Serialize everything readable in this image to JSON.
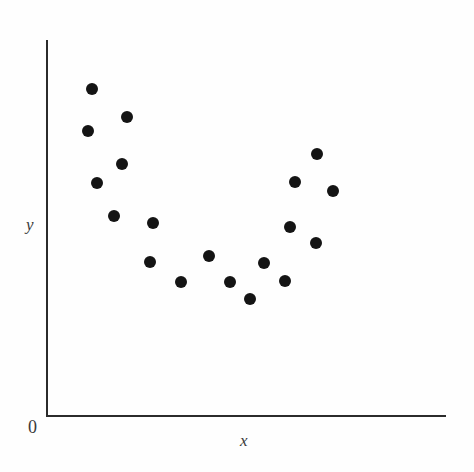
{
  "figure": {
    "width": 474,
    "height": 472,
    "background_color": "#fefefe",
    "axis_color": "#2b2b2b",
    "point_color": "#141414",
    "point_diameter": 12
  },
  "axes": {
    "y_label": "y",
    "x_label": "x",
    "origin_label": "0",
    "y_axis": {
      "x": 46,
      "y_top": 40,
      "y_bottom": 416,
      "thickness": 2
    },
    "x_axis": {
      "y": 415,
      "x_left": 46,
      "x_right": 446,
      "thickness": 2
    },
    "y_label_pos": {
      "x": 26,
      "y": 216
    },
    "x_label_pos": {
      "x": 240,
      "y": 432
    },
    "origin_label_pos": {
      "x": 28,
      "y": 418
    }
  },
  "chart_data": {
    "type": "scatter",
    "title": "",
    "subtitle": "",
    "xlabel": "x",
    "ylabel": "y",
    "grid": false,
    "legend": null,
    "axis_ticks": {
      "x": [],
      "y": []
    },
    "axis_origin_label": "0",
    "relationship": "curvilinear (U-shaped / quadratic) relationship between x and y",
    "n_points": 21,
    "xlim": [
      0,
      1
    ],
    "ylim": [
      0,
      1
    ],
    "points_px": [
      {
        "x": 92,
        "y": 89
      },
      {
        "x": 127,
        "y": 117
      },
      {
        "x": 88,
        "y": 131
      },
      {
        "x": 122,
        "y": 164
      },
      {
        "x": 97,
        "y": 183
      },
      {
        "x": 114,
        "y": 216
      },
      {
        "x": 153,
        "y": 223
      },
      {
        "x": 150,
        "y": 262
      },
      {
        "x": 181,
        "y": 282
      },
      {
        "x": 209,
        "y": 256
      },
      {
        "x": 230,
        "y": 282
      },
      {
        "x": 250,
        "y": 299
      },
      {
        "x": 264,
        "y": 263
      },
      {
        "x": 285,
        "y": 281
      },
      {
        "x": 290,
        "y": 227
      },
      {
        "x": 316,
        "y": 243
      },
      {
        "x": 295,
        "y": 182
      },
      {
        "x": 317,
        "y": 154
      },
      {
        "x": 333,
        "y": 191
      }
    ],
    "points_data": [
      {
        "x": 0.115,
        "y": 0.868
      },
      {
        "x": 0.203,
        "y": 0.793
      },
      {
        "x": 0.105,
        "y": 0.756
      },
      {
        "x": 0.19,
        "y": 0.668
      },
      {
        "x": 0.128,
        "y": 0.619
      },
      {
        "x": 0.17,
        "y": 0.531
      },
      {
        "x": 0.268,
        "y": 0.513
      },
      {
        "x": 0.26,
        "y": 0.409
      },
      {
        "x": 0.338,
        "y": 0.356
      },
      {
        "x": 0.408,
        "y": 0.425
      },
      {
        "x": 0.46,
        "y": 0.356
      },
      {
        "x": 0.51,
        "y": 0.311
      },
      {
        "x": 0.545,
        "y": 0.407
      },
      {
        "x": 0.598,
        "y": 0.359
      },
      {
        "x": 0.61,
        "y": 0.503
      },
      {
        "x": 0.675,
        "y": 0.46
      },
      {
        "x": 0.623,
        "y": 0.62
      },
      {
        "x": 0.678,
        "y": 0.695
      },
      {
        "x": 0.718,
        "y": 0.596
      }
    ]
  }
}
